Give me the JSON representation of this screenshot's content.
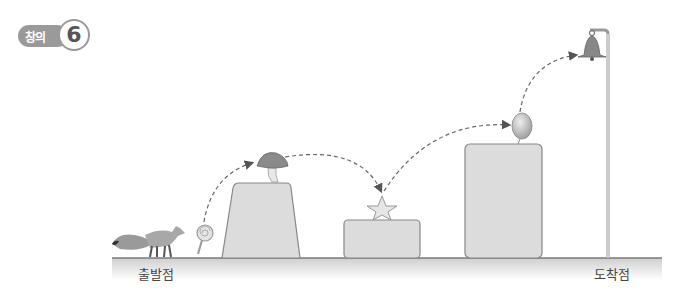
{
  "badge": {
    "label": "창의",
    "number": "6"
  },
  "labels": {
    "start": "출발점",
    "finish": "도착점"
  },
  "path": {
    "start": "fox",
    "stops": [
      "lollipop",
      "mushroom",
      "star",
      "balloon",
      "bell"
    ],
    "platforms": [
      {
        "name": "trapezoid-platform",
        "item": "mushroom"
      },
      {
        "name": "low-platform",
        "item": "star"
      },
      {
        "name": "tall-platform",
        "item": "balloon"
      }
    ],
    "end": "bell"
  },
  "colors": {
    "ground": "#8a8a8a",
    "platform_fill": "#dcdcdc",
    "platform_stroke": "#888888",
    "dash": "#666666",
    "badge": "#9a9a9a"
  }
}
